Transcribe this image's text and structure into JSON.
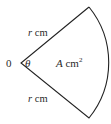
{
  "diagram": {
    "type": "circle-sector",
    "center_label": "0",
    "angle_label": "θ",
    "upper_radius_label": {
      "var": "r",
      "unit": " cm"
    },
    "lower_radius_label": {
      "var": "r",
      "unit": " cm"
    },
    "area_label": {
      "var": "A",
      "unit": " cm",
      "exp": "2"
    },
    "stroke_color": "#222222"
  }
}
